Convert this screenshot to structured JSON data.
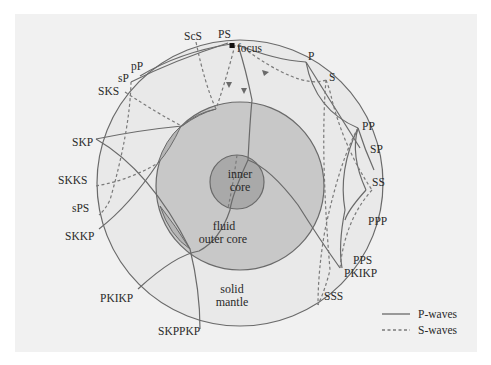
{
  "diagram": {
    "regions": {
      "inner_core": [
        "inner",
        "core"
      ],
      "outer_core": [
        "fluid",
        "outer core"
      ],
      "mantle": [
        "solid",
        "mantle"
      ]
    },
    "focus_label": "focus",
    "phase_labels": {
      "PS": "PS",
      "ScS": "ScS",
      "pP": "pP",
      "sP": "sP",
      "SKS": "SKS",
      "SKP": "SKP",
      "SKKS": "SKKS",
      "sPS": "sPS",
      "SKKP": "SKKP",
      "PKIKP_left": "PKIKP",
      "SKPPKP": "SKPPKP",
      "P": "P",
      "S": "S",
      "PP": "PP",
      "SP": "SP",
      "SS": "SS",
      "PPP": "PPP",
      "PPS": "PPS",
      "PKIKP_right": "PKIKP",
      "SSS": "SSS"
    },
    "legend": [
      {
        "label": "P-waves",
        "style": "solid"
      },
      {
        "label": "S-waves",
        "style": "dashed"
      }
    ],
    "colors": {
      "panel": "#f1f1f1",
      "mantle": "#e9e9e9",
      "outer_core": "#c8c8c8",
      "inner_core": "#a9a9a9",
      "line": "#6a6a6a"
    }
  }
}
